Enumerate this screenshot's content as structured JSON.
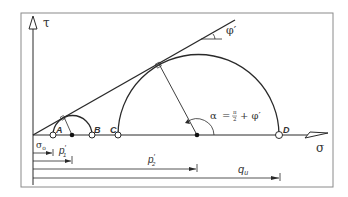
{
  "diagram": {
    "colors": {
      "stroke": "#2a2a2a",
      "frame": "#888888",
      "background": "#ffffff"
    },
    "axes": {
      "y_label": "τ",
      "x_label": "σ"
    },
    "envelope": {
      "angle_label": "φ′"
    },
    "points": [
      {
        "id": "A",
        "label": "A"
      },
      {
        "id": "B",
        "label": "B"
      },
      {
        "id": "C",
        "label": "C"
      },
      {
        "id": "D",
        "label": "D"
      }
    ],
    "angle_annotation": {
      "alpha": "α",
      "equals": "=",
      "pi": "π",
      "two": "2",
      "plus_phi": "+ φ′"
    },
    "dimensions": [
      {
        "id": "sigma0",
        "label": "σ",
        "sub": "o"
      },
      {
        "id": "p1",
        "label": "p",
        "sup": "′",
        "sub": "1"
      },
      {
        "id": "p2",
        "label": "p",
        "sup": "′",
        "sub": "2"
      },
      {
        "id": "qu",
        "label": "q",
        "sub": "u"
      }
    ]
  }
}
